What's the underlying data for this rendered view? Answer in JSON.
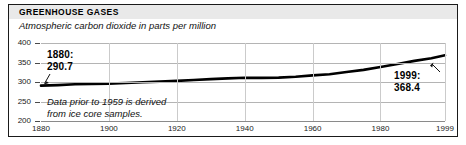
{
  "figure": {
    "headline": "GREENHOUSE GASES",
    "subhead": "Atmospheric carbon dioxide in parts per million",
    "footnote": "Data prior to 1959 is derived\nfrom ice core samples.",
    "callout_start": "1880:\n290.7",
    "callout_start_year": "1880:",
    "callout_start_value": "290.7",
    "callout_end_year": "1999:",
    "callout_end_value": "368.4",
    "colors": {
      "line": "#000000",
      "grid": "#b4b4b4",
      "frame": "#1a1a1a",
      "title_band": "#e9e9e9",
      "text": "#000000"
    }
  },
  "chart_data": {
    "type": "line",
    "title": "GREENHOUSE GASES",
    "subtitle": "Atmospheric carbon dioxide in parts per million",
    "xlabel": "",
    "ylabel": "",
    "units": "parts per million",
    "grid": true,
    "legend": false,
    "xlim": [
      1880,
      1999
    ],
    "ylim": [
      200,
      400
    ],
    "yticks": [
      200,
      250,
      300,
      350,
      400
    ],
    "ytick_labels": [
      "200",
      "250",
      "300",
      "350",
      "400"
    ],
    "xticks": [
      1880,
      1900,
      1920,
      1940,
      1960,
      1980,
      1999
    ],
    "xtick_labels": [
      "1880",
      "1900",
      "1920",
      "1940",
      "1960",
      "1980",
      "1999"
    ],
    "annotations": [
      {
        "label": "1880: 290.7",
        "x": 1880,
        "y": 290.7
      },
      {
        "label": "1999: 368.4",
        "x": 1999,
        "y": 368.4
      },
      {
        "label": "Data prior to 1959 is derived from ice core samples.",
        "x": null,
        "y": null
      }
    ],
    "series": [
      {
        "name": "Atmospheric CO2",
        "x": [
          1880,
          1885,
          1890,
          1895,
          1900,
          1905,
          1910,
          1915,
          1920,
          1925,
          1930,
          1935,
          1940,
          1945,
          1950,
          1955,
          1960,
          1965,
          1970,
          1975,
          1980,
          1985,
          1990,
          1995,
          1999
        ],
        "values": [
          290.7,
          292.0,
          294.2,
          294.8,
          295.8,
          297.3,
          299.3,
          301.0,
          302.9,
          305.0,
          307.3,
          309.4,
          310.8,
          310.5,
          311.3,
          313.6,
          316.9,
          320.0,
          325.7,
          331.1,
          338.7,
          346.0,
          354.2,
          360.8,
          368.4
        ]
      }
    ]
  }
}
